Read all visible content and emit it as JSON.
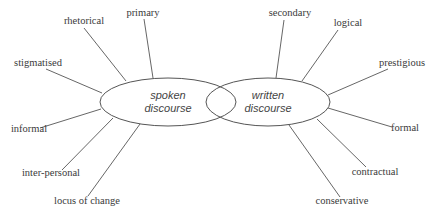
{
  "diagram": {
    "type": "dual-ellipse concept map",
    "left_node": {
      "line1": "spoken",
      "line2": "discourse",
      "attributes": [
        "rhetorical",
        "primary",
        "stigmatised",
        "informal",
        "inter-personal",
        "locus of change"
      ]
    },
    "right_node": {
      "line1": "written",
      "line2": "discourse",
      "attributes": [
        "secondary",
        "logical",
        "prestigious",
        "formal",
        "contractual",
        "conservative"
      ]
    },
    "colors": {
      "line": "#555555",
      "text": "#3a3a3a",
      "background": "#ffffff"
    }
  }
}
